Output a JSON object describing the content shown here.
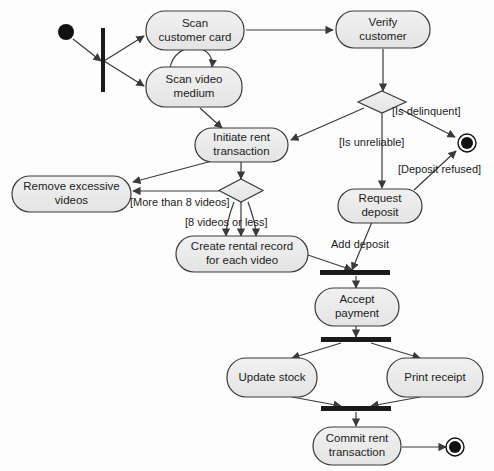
{
  "diagram": {
    "type": "uml-activity-diagram",
    "palette": {
      "node_fill": "#ececec",
      "node_stroke": "#3a3a3a",
      "edge_stroke": "#3a3a3a",
      "bar_fill": "#1a1a1a",
      "terminal_fill": "#111111",
      "background": "#fdfdfd",
      "text": "#1b1b1b"
    },
    "nodes": [
      {
        "id": "start",
        "kind": "initial-node",
        "label": ""
      },
      {
        "id": "fork-initial",
        "kind": "fork-bar",
        "label": ""
      },
      {
        "id": "scan-customer-card",
        "kind": "action",
        "label": "Scan\ncustomer card"
      },
      {
        "id": "scan-video-medium",
        "kind": "action",
        "label": "Scan video\nmedium"
      },
      {
        "id": "verify-customer",
        "kind": "action",
        "label": "Verify\ncustomer"
      },
      {
        "id": "customer-decision",
        "kind": "decision",
        "label": ""
      },
      {
        "id": "initiate-rent",
        "kind": "action",
        "label": "Initiate rent\ntransaction"
      },
      {
        "id": "video-count-decision",
        "kind": "decision",
        "label": ""
      },
      {
        "id": "remove-excessive",
        "kind": "action",
        "label": "Remove excessive\nvideos"
      },
      {
        "id": "create-rental-record",
        "kind": "action",
        "label": "Create rental record\nfor each video"
      },
      {
        "id": "request-deposit",
        "kind": "action",
        "label": "Request\ndeposit"
      },
      {
        "id": "join-deposit",
        "kind": "join-bar",
        "label": ""
      },
      {
        "id": "accept-payment",
        "kind": "action",
        "label": "Accept\npayment"
      },
      {
        "id": "fork-finish",
        "kind": "fork-bar",
        "label": ""
      },
      {
        "id": "update-stock",
        "kind": "action",
        "label": "Update stock"
      },
      {
        "id": "print-receipt",
        "kind": "action",
        "label": "Print receipt"
      },
      {
        "id": "join-finish",
        "kind": "join-bar",
        "label": ""
      },
      {
        "id": "commit-rent",
        "kind": "action",
        "label": "Commit rent\ntransaction"
      },
      {
        "id": "end-delinquent",
        "kind": "final-node",
        "label": ""
      },
      {
        "id": "end-complete",
        "kind": "final-node",
        "label": ""
      }
    ],
    "edge_labels": [
      {
        "id": "is-delinquent",
        "text": "[Is delinquent]"
      },
      {
        "id": "is-unreliable",
        "text": "[Is unreliable]"
      },
      {
        "id": "deposit-refused",
        "text": "[Deposit refused]"
      },
      {
        "id": "more-than-8",
        "text": "[More than 8 videos]"
      },
      {
        "id": "8-or-less",
        "text": "[8 videos or less]"
      },
      {
        "id": "add-deposit",
        "text": "Add deposit"
      }
    ]
  }
}
